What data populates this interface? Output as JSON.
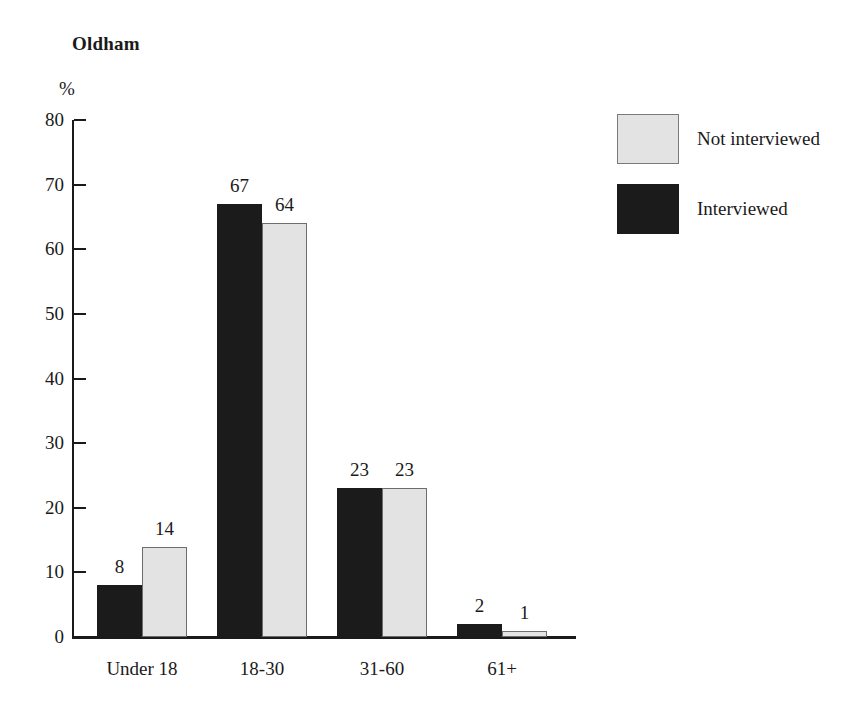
{
  "chart_data": {
    "type": "bar",
    "title": "Oldham",
    "xlabel": "",
    "ylabel": "%",
    "ylim": [
      0,
      80
    ],
    "yticks": [
      0,
      10,
      20,
      30,
      40,
      50,
      60,
      70,
      80
    ],
    "grid": false,
    "legend_position": "right",
    "categories": [
      "Under 18",
      "18-30",
      "31-60",
      "61+"
    ],
    "series": [
      {
        "name": "Interviewed",
        "color": "#1b1b1b",
        "values": [
          8,
          67,
          23,
          2
        ]
      },
      {
        "name": "Not interviewed",
        "color": "#e3e3e3",
        "values": [
          14,
          64,
          23,
          1
        ]
      }
    ],
    "legend_order": [
      "Not interviewed",
      "Interviewed"
    ]
  },
  "legend": {
    "items": [
      {
        "label": "Not interviewed",
        "swatch": "light"
      },
      {
        "label": "Interviewed",
        "swatch": "dark"
      }
    ]
  },
  "axis": {
    "unit_label": "%",
    "tick_labels": [
      "80",
      "70",
      "60",
      "50",
      "40",
      "30",
      "20",
      "10",
      "0"
    ]
  },
  "bar_value_labels": {
    "group0": [
      "8",
      "14"
    ],
    "group1": [
      "67",
      "64"
    ],
    "group2": [
      "23",
      "23"
    ],
    "group3": [
      "2",
      "1"
    ]
  }
}
